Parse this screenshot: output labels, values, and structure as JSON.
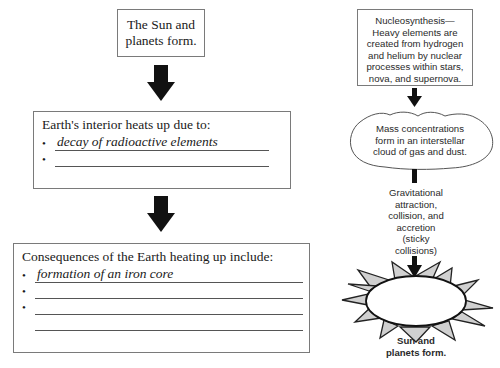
{
  "left_flow": {
    "top_box": {
      "line1": "The Sun and",
      "line2": "planets form."
    },
    "heat_box": {
      "heading": "Earth's interior heats up due to:",
      "bullets": [
        {
          "text": "decay of radioactive elements"
        },
        {
          "text": ""
        }
      ]
    },
    "consequences_box": {
      "heading": "Consequences of the Earth heating up include:",
      "bullets": [
        {
          "text": "formation of an iron core"
        },
        {
          "text": ""
        },
        {
          "text": ""
        }
      ],
      "extra_blank_lines": 1
    }
  },
  "right_flow": {
    "nucleosynthesis": {
      "lines": [
        "Nucleosynthesis—",
        "Heavy elements are",
        "created from hydrogen",
        "and helium by nuclear",
        "processes within stars,",
        "nova, and supernova."
      ]
    },
    "cloud": {
      "lines": [
        "Mass concentrations",
        "form in an interstellar",
        "cloud of gas and dust."
      ]
    },
    "gravitation": {
      "lines": [
        "Gravitational",
        "attraction,",
        "collision, and",
        "accretion",
        "(sticky",
        "collisions)"
      ]
    },
    "sun": {
      "label_line1": "Sun and",
      "label_line2": "planets form."
    }
  },
  "icons": {
    "arrow": "down-arrow-icon",
    "cloud": "cloud-shape",
    "sun": "sun-shape"
  },
  "colors": {
    "arrow": "#111111",
    "border": "#7a7a7a",
    "sun_rays": "#d0d0d0",
    "text": "#1a1a1a"
  }
}
